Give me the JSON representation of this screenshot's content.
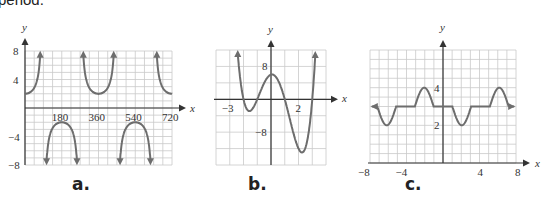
{
  "header": {
    "caption_fragment": "period."
  },
  "panels": [
    {
      "label": "a."
    },
    {
      "label": "b."
    },
    {
      "label": "c."
    }
  ],
  "chart_data": [
    {
      "type": "line",
      "panel": "a.",
      "title": "",
      "xlabel": "x",
      "ylabel": "y",
      "function_description": "y = 2 sec(x), x in degrees",
      "xlim": [
        0,
        720
      ],
      "ylim": [
        -8,
        8
      ],
      "x_ticks": [
        180,
        360,
        540,
        720
      ],
      "y_ticks": [
        8,
        4,
        -4,
        -8
      ],
      "grid": true,
      "vertical_asymptotes": [
        90,
        270,
        450,
        630
      ],
      "local_minima": [
        [
          0,
          2
        ],
        [
          360,
          2
        ],
        [
          720,
          2
        ]
      ],
      "local_maxima": [
        [
          180,
          -2
        ],
        [
          540,
          -2
        ]
      ],
      "x": [
        0,
        45,
        70,
        80,
        100,
        110,
        135,
        180,
        225,
        250,
        260,
        280,
        290,
        315,
        360,
        405,
        430,
        440,
        460,
        470,
        495,
        540,
        585,
        610,
        620,
        640,
        650,
        675,
        720
      ],
      "values": [
        2,
        2.83,
        5.85,
        11.5,
        -11.5,
        -5.85,
        -2.83,
        -2,
        -2.83,
        -5.85,
        -11.5,
        11.5,
        5.85,
        2.83,
        2,
        2.83,
        5.85,
        11.5,
        -11.5,
        -5.85,
        -2.83,
        -2,
        -2.83,
        -5.85,
        -11.5,
        11.5,
        5.85,
        2.83,
        2
      ]
    },
    {
      "type": "line",
      "panel": "b.",
      "title": "",
      "xlabel": "x",
      "ylabel": "y",
      "function_description": "polynomial with roots near -2, -1, 1, 3",
      "xlim": [
        -4,
        4
      ],
      "ylim": [
        -16,
        12
      ],
      "x_ticks": [
        -3,
        2
      ],
      "y_ticks": [
        8,
        -8
      ],
      "grid": true,
      "x": [
        -2.5,
        -2,
        -1.7,
        -1.5,
        -1,
        -0.5,
        0,
        0.2,
        0.5,
        1,
        1.5,
        2,
        2.3,
        2.6,
        3,
        3.3
      ],
      "values": [
        8.75,
        0,
        -2.3,
        -1.9,
        0,
        3.9,
        6,
        6.1,
        5.1,
        0,
        -6.6,
        -12,
        -12.9,
        -11.1,
        0,
        13.2
      ]
    },
    {
      "type": "line",
      "panel": "c.",
      "title": "",
      "xlabel": "x",
      "ylabel": "y",
      "function_description": "periodic function, period 8: dips to 2, flat at 3, bumps to 4",
      "xlim": [
        -8,
        8
      ],
      "ylim": [
        0,
        6
      ],
      "x_ticks": [
        -8,
        -4,
        4,
        8
      ],
      "y_ticks": [
        4,
        2
      ],
      "grid": true,
      "x": [
        -7,
        -6,
        -5,
        -3,
        -2,
        -1,
        1,
        2,
        3,
        5,
        6,
        7
      ],
      "values": [
        3,
        2,
        3,
        3,
        4,
        3,
        3,
        2,
        3,
        3,
        4,
        3
      ]
    }
  ]
}
